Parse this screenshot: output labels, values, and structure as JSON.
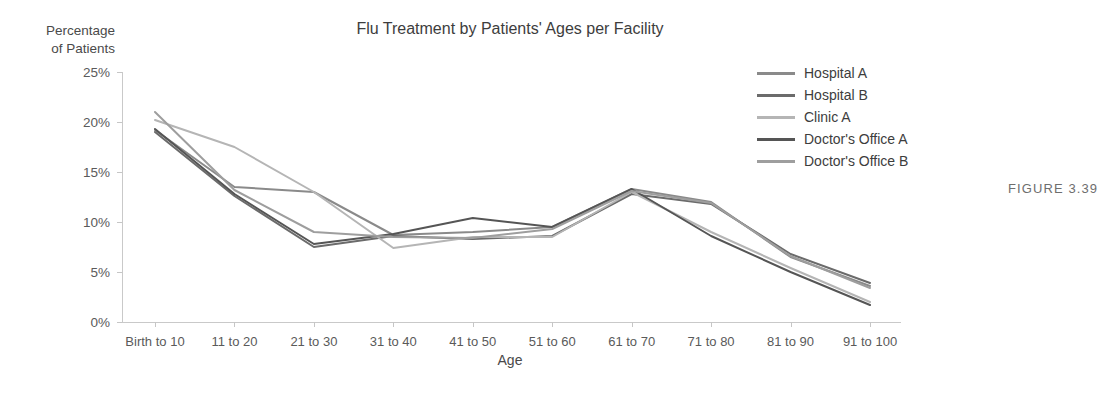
{
  "chart_data": {
    "type": "line",
    "title": "Flu Treatment by Patients' Ages per Facility",
    "xlabel": "Age",
    "ylabel": "Percentage of Patients",
    "ylabel_lines": [
      "Percentage",
      "of Patients"
    ],
    "ylim": [
      0,
      25
    ],
    "ytick_values": [
      0,
      5,
      10,
      15,
      20,
      25
    ],
    "ytick_labels": [
      "0%",
      "5%",
      "10%",
      "15%",
      "20%",
      "25%"
    ],
    "grid": false,
    "legend_position": "top-right",
    "categories": [
      "Birth to 10",
      "11 to 20",
      "21 to 30",
      "31 to 40",
      "41 to 50",
      "51 to 60",
      "61 to 70",
      "71 to 80",
      "81 to 90",
      "91 to 100"
    ],
    "series": [
      {
        "name": "Hospital A",
        "color": "#8a8a8a",
        "values": [
          19.2,
          13.5,
          13.0,
          8.7,
          9.0,
          9.5,
          13.3,
          12.0,
          6.5,
          3.6
        ]
      },
      {
        "name": "Hospital B",
        "color": "#6b6b6b",
        "values": [
          19.0,
          12.6,
          7.5,
          8.6,
          8.3,
          8.6,
          12.8,
          11.8,
          6.8,
          3.9
        ]
      },
      {
        "name": "Clinic A",
        "color": "#b5b5b5",
        "values": [
          20.2,
          17.5,
          13.0,
          7.4,
          8.5,
          8.5,
          13.0,
          9.0,
          5.4,
          2.0
        ]
      },
      {
        "name": "Doctor's Office A",
        "color": "#555555",
        "values": [
          19.3,
          12.8,
          7.8,
          8.8,
          10.4,
          9.5,
          13.3,
          8.6,
          5.0,
          1.7
        ]
      },
      {
        "name": "Doctor's Office B",
        "color": "#9e9e9e",
        "values": [
          21.0,
          13.2,
          9.0,
          8.5,
          8.4,
          9.3,
          13.1,
          11.9,
          6.6,
          3.4
        ]
      }
    ],
    "annotations": [
      {
        "name": "figure-number",
        "text": "FIGURE 3.39"
      }
    ]
  },
  "caption": {
    "figure_number": "FIGURE 3.39"
  }
}
